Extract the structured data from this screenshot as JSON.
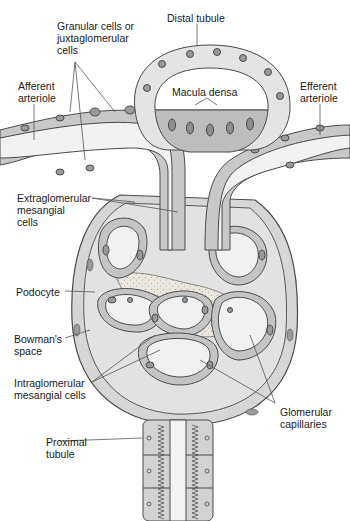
{
  "diagram": {
    "colors": {
      "outline": "#4a4a4a",
      "cell_light": "#e6e6e6",
      "cell_mid": "#c8c8c8",
      "cell_dark": "#a8a8a8",
      "nucleus": "#8e8e8e",
      "lumen": "#f2f2f2",
      "space": "#dcdcdc",
      "mesangium": "#e9e4dc",
      "leader": "#555555"
    },
    "labels": {
      "granular_cells": "Granular cells or\njuxtaglomerular\ncells",
      "distal_tubule": "Distal tubule",
      "afferent_arteriole": "Afferent\narteriole",
      "macula_densa": "Macula densa",
      "efferent_arteriole": "Efferent\narteriole",
      "extraglomerular_mesangial": "Extraglomerular\nmesangial\ncells",
      "podocyte": "Podocyte",
      "bowmans_space": "Bowman's\nspace",
      "intraglomerular_mesangial": "Intraglomerular\nmesangial cells",
      "glomerular_capillaries": "Glomerular\ncapillaries",
      "proximal_tubule": "Proximal\ntubule"
    }
  }
}
